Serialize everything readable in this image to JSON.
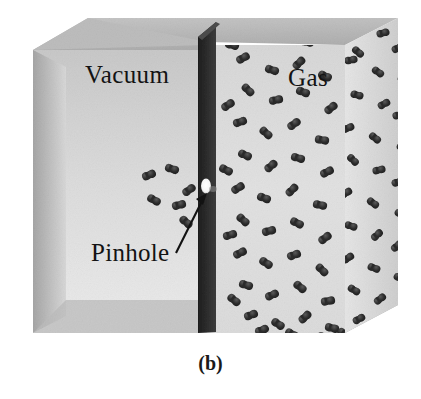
{
  "figure": {
    "caption": "(b)",
    "labels": {
      "vacuum": "Vacuum",
      "gas": "Gas",
      "pinhole": "Pinhole"
    }
  },
  "colors": {
    "background": "#ffffff",
    "text": "#131313",
    "box_front_left": "#d6d6d6",
    "box_front_right": "#d2d2d2",
    "box_top": "#b9b9b9",
    "box_floor": "#b0b0b0",
    "box_side_right": "#dcdcdc",
    "partition_dark": "#2a2a2a",
    "partition_top": "#4a4a4a",
    "pinhole": "#fdfdfd",
    "molecule": "#2b2b2b",
    "arrow": "#121212"
  },
  "scene": {
    "type": "effusion-3d-box",
    "chambers": [
      {
        "name": "vacuum",
        "side": "left",
        "molecule_count": 6
      },
      {
        "name": "gas",
        "side": "right",
        "molecule_count": 78
      }
    ],
    "partition": {
      "name": "divider-wall",
      "has_pinhole": true
    },
    "annotation": {
      "name": "pinhole-arrow",
      "from": [
        178,
        252
      ],
      "to": [
        207,
        196
      ]
    }
  },
  "chart_data": {
    "type": "diagram",
    "title": "(b)",
    "regions": [
      {
        "label": "Vacuum",
        "molecules": 6
      },
      {
        "label": "Gas",
        "molecules": 78
      }
    ],
    "annotations": [
      "Pinhole"
    ]
  },
  "gas_molecules": [
    [
      253,
      31,
      22
    ],
    [
      279,
      25,
      -38
    ],
    [
      307,
      42,
      12
    ],
    [
      337,
      30,
      -20
    ],
    [
      358,
      52,
      40
    ],
    [
      383,
      33,
      -15
    ],
    [
      243,
      58,
      -30
    ],
    [
      272,
      70,
      18
    ],
    [
      299,
      63,
      -45
    ],
    [
      325,
      76,
      25
    ],
    [
      351,
      60,
      -10
    ],
    [
      378,
      72,
      35
    ],
    [
      398,
      48,
      -25
    ],
    [
      248,
      90,
      45
    ],
    [
      276,
      100,
      -12
    ],
    [
      303,
      92,
      20
    ],
    [
      331,
      108,
      -38
    ],
    [
      357,
      95,
      15
    ],
    [
      384,
      104,
      -28
    ],
    [
      404,
      80,
      30
    ],
    [
      240,
      122,
      -18
    ],
    [
      266,
      133,
      42
    ],
    [
      294,
      124,
      -35
    ],
    [
      322,
      140,
      10
    ],
    [
      348,
      128,
      -22
    ],
    [
      375,
      138,
      38
    ],
    [
      399,
      115,
      -14
    ],
    [
      245,
      155,
      25
    ],
    [
      271,
      166,
      -40
    ],
    [
      298,
      158,
      16
    ],
    [
      327,
      172,
      -26
    ],
    [
      353,
      160,
      44
    ],
    [
      379,
      170,
      -12
    ],
    [
      403,
      148,
      28
    ],
    [
      238,
      188,
      -32
    ],
    [
      264,
      198,
      20
    ],
    [
      292,
      190,
      -44
    ],
    [
      320,
      205,
      13
    ],
    [
      346,
      193,
      -30
    ],
    [
      373,
      203,
      36
    ],
    [
      398,
      182,
      -18
    ],
    [
      243,
      220,
      41
    ],
    [
      269,
      231,
      -15
    ],
    [
      297,
      223,
      27
    ],
    [
      325,
      238,
      -36
    ],
    [
      351,
      226,
      19
    ],
    [
      377,
      235,
      -42
    ],
    [
      401,
      214,
      24
    ],
    [
      240,
      253,
      -27
    ],
    [
      266,
      263,
      33
    ],
    [
      294,
      255,
      -19
    ],
    [
      322,
      270,
      45
    ],
    [
      348,
      258,
      -33
    ],
    [
      374,
      268,
      21
    ],
    [
      397,
      246,
      -40
    ],
    [
      246,
      285,
      17
    ],
    [
      272,
      295,
      -24
    ],
    [
      300,
      287,
      39
    ],
    [
      328,
      301,
      -11
    ],
    [
      354,
      290,
      31
    ],
    [
      380,
      299,
      -37
    ],
    [
      400,
      278,
      23
    ],
    [
      251,
      315,
      -20
    ],
    [
      278,
      324,
      34
    ],
    [
      305,
      317,
      -43
    ],
    [
      332,
      328,
      14
    ],
    [
      359,
      319,
      -29
    ],
    [
      383,
      326,
      41
    ],
    [
      232,
      45,
      15
    ],
    [
      228,
      105,
      -33
    ],
    [
      226,
      170,
      27
    ],
    [
      230,
      235,
      -16
    ],
    [
      234,
      300,
      38
    ],
    [
      262,
      330,
      -21
    ],
    [
      292,
      334,
      29
    ],
    [
      318,
      337,
      -13
    ],
    [
      344,
      334,
      36
    ],
    [
      368,
      332,
      -26
    ]
  ],
  "vacuum_molecules": [
    [
      149,
      175,
      -22
    ],
    [
      172,
      169,
      18
    ],
    [
      189,
      190,
      -35
    ],
    [
      154,
      200,
      30
    ],
    [
      179,
      205,
      -15
    ],
    [
      186,
      222,
      40
    ]
  ]
}
